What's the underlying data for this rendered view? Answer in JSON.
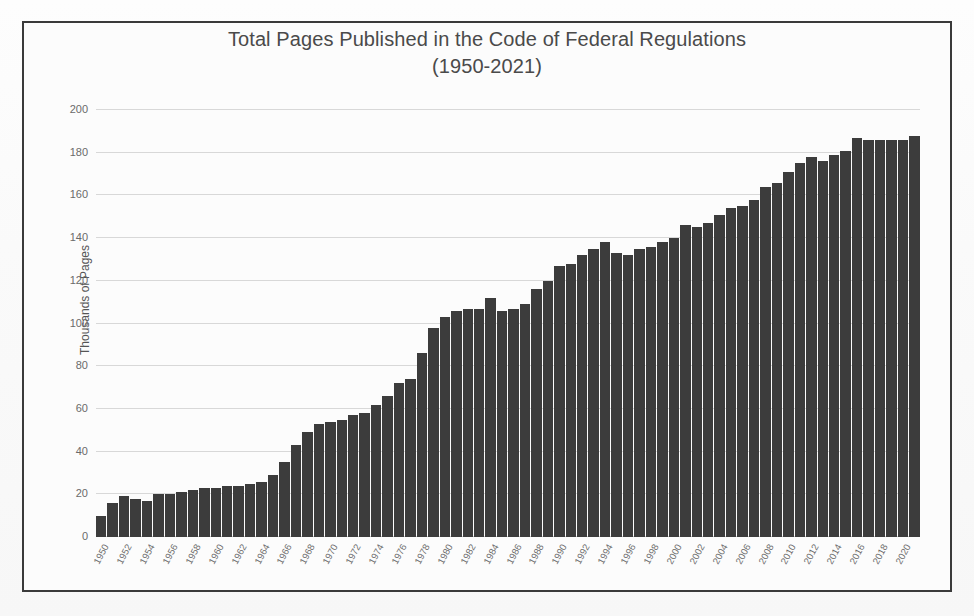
{
  "figure": {
    "title": "Total Pages Published in the Code of Federal Regulations\n(1950-2021)",
    "y_axis_title": "Thousands of Pages",
    "bar_color": "#3c3c3c",
    "grid_color": "#d8d8d8",
    "border_color": "#3a3a3a",
    "background": "#fcfcfc",
    "text_color": "#4a4a4a"
  },
  "chart_data": {
    "type": "bar",
    "title": "Total Pages Published in the Code of Federal Regulations (1950-2021)",
    "xlabel": "",
    "ylabel": "Thousands of Pages",
    "ylim": [
      0,
      200
    ],
    "ytick_step": 20,
    "grid": true,
    "legend": false,
    "xtick_label_interval": 2,
    "xtick_rotation": -62,
    "yticks": [
      0,
      20,
      40,
      60,
      80,
      100,
      120,
      140,
      160,
      180,
      200
    ],
    "ytick_labels": [
      "0",
      "20",
      "40",
      "60",
      "80",
      "100",
      "120",
      "140",
      "160",
      "180",
      "200"
    ],
    "categories": [
      "1950",
      "1951",
      "1952",
      "1953",
      "1954",
      "1955",
      "1956",
      "1957",
      "1958",
      "1959",
      "1960",
      "1961",
      "1962",
      "1963",
      "1964",
      "1965",
      "1966",
      "1967",
      "1968",
      "1969",
      "1970",
      "1971",
      "1972",
      "1973",
      "1974",
      "1975",
      "1976",
      "1977",
      "1978",
      "1979",
      "1980",
      "1981",
      "1982",
      "1983",
      "1984",
      "1985",
      "1986",
      "1987",
      "1988",
      "1989",
      "1990",
      "1991",
      "1992",
      "1993",
      "1994",
      "1995",
      "1996",
      "1997",
      "1998",
      "1999",
      "2000",
      "2001",
      "2002",
      "2003",
      "2004",
      "2005",
      "2006",
      "2007",
      "2008",
      "2009",
      "2010",
      "2011",
      "2012",
      "2013",
      "2014",
      "2015",
      "2016",
      "2017",
      "2018",
      "2019",
      "2020",
      "2021"
    ],
    "tick_labels_shown": [
      "1950",
      "1952",
      "1954",
      "1956",
      "1958",
      "1960",
      "1962",
      "1964",
      "1966",
      "1968",
      "1970",
      "1972",
      "1974",
      "1976",
      "1978",
      "1980",
      "1982",
      "1984",
      "1986",
      "1988",
      "1990",
      "1992",
      "1994",
      "1996",
      "1998",
      "2000",
      "2002",
      "2004",
      "2006",
      "2008",
      "2010",
      "2012",
      "2014",
      "2016",
      "2018",
      "2020"
    ],
    "values": [
      10,
      16,
      19,
      18,
      17,
      20,
      20,
      21,
      22,
      23,
      23,
      24,
      24,
      25,
      26,
      29,
      35,
      43,
      49,
      53,
      54,
      55,
      57,
      58,
      62,
      66,
      72,
      74,
      86,
      98,
      103,
      106,
      107,
      107,
      112,
      106,
      107,
      109,
      116,
      120,
      127,
      128,
      132,
      135,
      138,
      133,
      132,
      135,
      136,
      138,
      140,
      146,
      145,
      147,
      151,
      154,
      155,
      158,
      164,
      166,
      171,
      175,
      178,
      176,
      179,
      181,
      187,
      186,
      186,
      186,
      186,
      188
    ]
  }
}
